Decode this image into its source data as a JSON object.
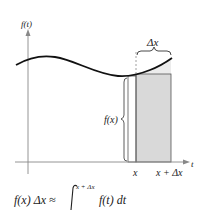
{
  "diagram": {
    "y_axis_label": "f(t)",
    "x_axis_label": "t",
    "delta_label": "Δx",
    "height_label": "f(x)",
    "tick_x": "x",
    "tick_x_plus": "x + Δx",
    "formula": {
      "lhs": "f(x) Δx ≈",
      "upper_limit": "x + Δx",
      "lower_limit": "x",
      "integrand": "f(t) dt"
    },
    "colors": {
      "curve": "#111111",
      "axis": "#888888",
      "shade": "#d9d9d9",
      "shade_light": "#ececec",
      "rect_edge": "#555555"
    }
  }
}
